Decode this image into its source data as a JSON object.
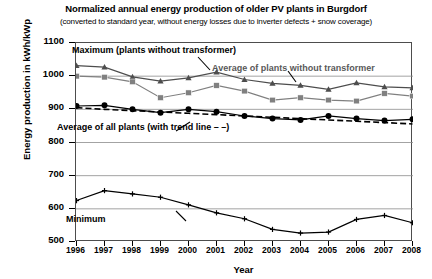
{
  "chart_data": {
    "type": "line",
    "title": "Normalized annual energy production of older PV plants in Burgdorf",
    "subtitle": "(converted to standard year, without energy losses due to inverter defects + snow coverage)",
    "xlabel": "Year",
    "ylabel": "Energy production in kWh/kWp",
    "x": [
      1996,
      1997,
      1998,
      1999,
      2000,
      2001,
      2002,
      2003,
      2004,
      2005,
      2006,
      2007,
      2008
    ],
    "categories": [
      "1996",
      "1997",
      "1998",
      "1999",
      "2000",
      "2001",
      "2002",
      "2003",
      "2004",
      "2005",
      "2006",
      "2007",
      "2008"
    ],
    "xlim": [
      1996,
      2008
    ],
    "ylim": [
      500,
      1100
    ],
    "yticks": [
      500,
      600,
      700,
      800,
      900,
      1000,
      1100
    ],
    "grid": true,
    "legend_position": "inline-annotations",
    "series": [
      {
        "name": "Maximum (plants without transformer)",
        "marker": "triangle",
        "color": "#4d4d4d",
        "values": [
          1032,
          1027,
          998,
          985,
          995,
          1012,
          990,
          978,
          972,
          960,
          980,
          968,
          965
        ]
      },
      {
        "name": "Average of plants without transformer",
        "marker": "square",
        "color": "#808080",
        "values": [
          1000,
          997,
          983,
          935,
          950,
          972,
          955,
          928,
          935,
          928,
          925,
          948,
          940
        ]
      },
      {
        "name": "Average of all plants (with trend line – –)",
        "marker": "circle",
        "color": "#000000",
        "values": [
          910,
          912,
          900,
          890,
          900,
          893,
          880,
          872,
          868,
          880,
          872,
          866,
          870
        ]
      },
      {
        "name": "Average of all plants trend line",
        "marker": "none",
        "style": "dashed",
        "color": "#000000",
        "values": [
          905,
          900,
          896,
          892,
          888,
          884,
          880,
          876,
          872,
          868,
          864,
          860,
          856
        ]
      },
      {
        "name": "Minimum",
        "marker": "cross",
        "color": "#000000",
        "values": [
          625,
          655,
          645,
          635,
          612,
          588,
          570,
          538,
          527,
          530,
          568,
          580,
          558
        ]
      }
    ],
    "annotations": [
      {
        "name": "maximum-label",
        "text": "Maximum (plants without transformer)"
      },
      {
        "name": "average-without-transformer-label",
        "text": "Average of plants without transformer"
      },
      {
        "name": "average-all-plants-label",
        "text": "Average of all plants (with trend line – –)"
      },
      {
        "name": "minimum-label",
        "text": "Minimum"
      }
    ]
  }
}
